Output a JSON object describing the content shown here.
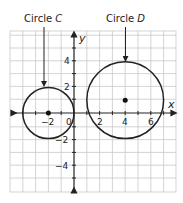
{
  "figure": {
    "labels": {
      "circle_c": "Circle ",
      "circle_c_letter": "C",
      "circle_d": "Circle ",
      "circle_d_letter": "D"
    },
    "axes": {
      "x_name": "x",
      "y_name": "y",
      "x_ticks": [
        "−2",
        "0",
        "2",
        "4",
        "6"
      ],
      "y_ticks": [
        "4",
        "2",
        "−2",
        "−4"
      ]
    },
    "circles": [
      {
        "name": "Circle C",
        "center": [
          -2,
          0
        ],
        "radius": 2
      },
      {
        "name": "Circle D",
        "center": [
          4,
          1
        ],
        "radius": 3
      }
    ],
    "colors": {
      "grid": "#c8c8c8",
      "stroke": "#222222"
    }
  }
}
